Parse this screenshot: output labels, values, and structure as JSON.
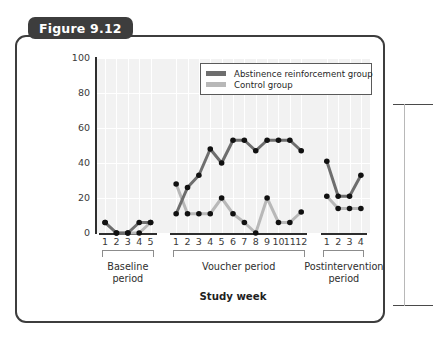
{
  "figure": {
    "tab_label": "Figure 9.12"
  },
  "chart_data": {
    "type": "line",
    "title": "Figure 9.12",
    "xlabel": "Study week",
    "ylabel": "Participants abstaining from cocaine use (percentage)",
    "ylim": [
      0,
      100
    ],
    "yticks": [
      0,
      20,
      40,
      60,
      80,
      100
    ],
    "grid": true,
    "legend_position": "top-right",
    "periods": [
      {
        "name": "Baseline period",
        "label_line1": "Baseline",
        "label_line2": "period",
        "weeks": [
          1,
          2,
          3,
          4,
          5
        ]
      },
      {
        "name": "Voucher period",
        "label_line1": "Voucher period",
        "label_line2": "",
        "weeks": [
          1,
          2,
          3,
          4,
          5,
          6,
          7,
          8,
          9,
          10,
          11,
          12
        ]
      },
      {
        "name": "Postintervention period",
        "label_line1": "Postintervention",
        "label_line2": "period",
        "weeks": [
          1,
          2,
          3,
          4
        ]
      }
    ],
    "series": [
      {
        "name": "Abstinence reinforcement group",
        "color": "#6e6e6e",
        "segments": [
          {
            "period": "Baseline period",
            "x": [
              1,
              2,
              3,
              4,
              5
            ],
            "values": [
              6,
              0,
              0,
              6,
              6
            ]
          },
          {
            "period": "Voucher period",
            "x": [
              1,
              2,
              3,
              4,
              5,
              6,
              7,
              8,
              9,
              10,
              11,
              12
            ],
            "values": [
              11,
              26,
              33,
              48,
              40,
              53,
              53,
              47,
              53,
              53,
              53,
              47
            ]
          },
          {
            "period": "Postintervention period",
            "x": [
              1,
              2,
              3,
              4
            ],
            "values": [
              41,
              21,
              21,
              33
            ]
          }
        ]
      },
      {
        "name": "Control group",
        "color": "#b8b8b8",
        "segments": [
          {
            "period": "Baseline period",
            "x": [
              1,
              2,
              3,
              4,
              5
            ],
            "values": [
              6,
              0,
              0,
              0,
              6
            ]
          },
          {
            "period": "Voucher period",
            "x": [
              1,
              2,
              3,
              4,
              5,
              6,
              7,
              8,
              9,
              10,
              11,
              12
            ],
            "values": [
              28,
              11,
              11,
              11,
              20,
              11,
              6,
              0,
              20,
              6,
              6,
              12
            ]
          },
          {
            "period": "Postintervention period",
            "x": [
              1,
              2,
              3,
              4
            ],
            "values": [
              21,
              14,
              14,
              14
            ]
          }
        ]
      }
    ]
  },
  "legend": {
    "items": [
      {
        "label": "Abstinence reinforcement group",
        "color": "#6e6e6e"
      },
      {
        "label": "Control group",
        "color": "#b8b8b8"
      }
    ]
  },
  "colors": {
    "plot_background": "#f2f2f2",
    "gridline": "#ffffff",
    "axis": "#2e2e2e",
    "card_border": "#3d3d3d",
    "tab_background": "#3d3d3d",
    "series_dark": "#6e6e6e",
    "series_light": "#b8b8b8",
    "marker": "#111111"
  }
}
